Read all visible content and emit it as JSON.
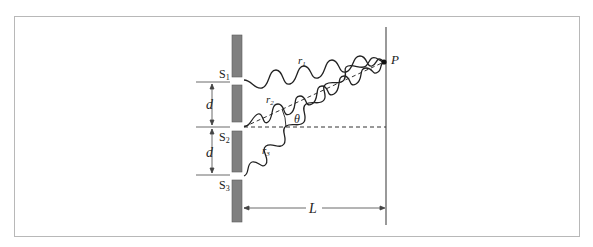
{
  "diagram": {
    "labels": {
      "slit1": "S",
      "slit1_sub": "1",
      "slit2": "S",
      "slit2_sub": "2",
      "slit3": "S",
      "slit3_sub": "3",
      "spacing_upper": "d",
      "spacing_lower": "d",
      "ray1": "r",
      "ray1_sub": "1",
      "ray2": "r",
      "ray2_sub": "2",
      "ray3": "r",
      "ray3_sub": "3",
      "angle": "θ",
      "point": "P",
      "distance": "L"
    },
    "colors": {
      "frame": "#b8b8b8",
      "barrier": "#808080",
      "barrier_stroke": "#555555",
      "lines": "#333333",
      "screen": "#555555"
    }
  }
}
